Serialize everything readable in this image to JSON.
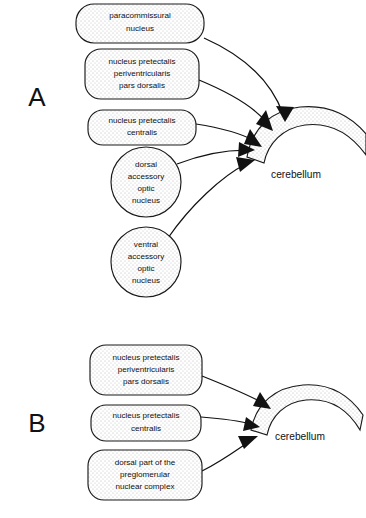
{
  "figure": {
    "background_color": "#ffffff",
    "ink_color": "#121212",
    "node_fill": "stippled-gray",
    "panels": [
      {
        "id": "A",
        "label": "A",
        "label_x": 37,
        "label_y": 99,
        "target": {
          "name": "cerebellum",
          "label": "cerebellum",
          "label_x": 296,
          "label_y": 175
        },
        "sources": [
          {
            "id": "paracommissural-nucleus",
            "shape": "rounded-rect",
            "lines": [
              "paracommissural",
              "nucleus"
            ],
            "x": 76,
            "y": 4,
            "w": 128,
            "h": 39
          },
          {
            "id": "nucleus-pretectalis-periventricularis-pars-dorsalis",
            "shape": "rounded-rect",
            "lines": [
              "nucleus pretectalis",
              "periventricularis",
              "pars dorsalis"
            ],
            "x": 85,
            "y": 49,
            "w": 114,
            "h": 50
          },
          {
            "id": "nucleus-pretectalis-centralis",
            "shape": "rounded-rect",
            "lines": [
              "nucleus pretectalis",
              "centralis"
            ],
            "x": 88,
            "y": 110,
            "w": 108,
            "h": 35
          },
          {
            "id": "dorsal-accessory-optic-nucleus",
            "shape": "circle",
            "lines": [
              "dorsal",
              "accessory",
              "optic",
              "nucleus"
            ],
            "cx": 146,
            "cy": 182,
            "r": 35
          },
          {
            "id": "ventral-accessory-optic-nucleus",
            "shape": "circle",
            "lines": [
              "ventral",
              "accessory",
              "optic",
              "nucleus"
            ],
            "cx": 146,
            "cy": 262,
            "r": 35
          }
        ],
        "connections": [
          {
            "from": "paracommissural-nucleus",
            "to": "cerebellum",
            "path": "M 204 38 C 240 54 270 78 283 114",
            "arrow_x": 285,
            "arrow_y": 120,
            "arrow_angle": 72
          },
          {
            "from": "nucleus-pretectalis-periventricularis-pars-dorsalis",
            "to": "cerebellum",
            "path": "M 199 80 C 228 92 254 106 268 124",
            "arrow_x": 271,
            "arrow_y": 128,
            "arrow_angle": 52
          },
          {
            "from": "nucleus-pretectalis-centralis",
            "to": "cerebellum",
            "path": "M 196 124 C 222 128 242 134 256 142",
            "arrow_x": 260,
            "arrow_y": 145,
            "arrow_angle": 33
          },
          {
            "from": "dorsal-accessory-optic-nucleus",
            "to": "cerebellum",
            "path": "M 177 164 C 205 153 230 150 249 150",
            "arrow_x": 254,
            "arrow_y": 150,
            "arrow_angle": 0
          },
          {
            "from": "ventral-accessory-optic-nucleus",
            "to": "cerebellum",
            "path": "M 168 238 C 190 206 222 176 248 163",
            "arrow_x": 253,
            "arrow_y": 160,
            "arrow_angle": -28
          }
        ]
      },
      {
        "id": "B",
        "label": "B",
        "label_x": 37,
        "label_y": 425,
        "target": {
          "name": "cerebellum",
          "label": "cerebellum",
          "label_x": 300,
          "label_y": 437
        },
        "sources": [
          {
            "id": "nucleus-pretectalis-periventricularis-pars-dorsalis",
            "shape": "rounded-rect",
            "lines": [
              "nucleus pretectalis",
              "periventricularis",
              "pars dorsalis"
            ],
            "x": 90,
            "y": 345,
            "w": 112,
            "h": 50
          },
          {
            "id": "nucleus-pretectalis-centralis",
            "shape": "rounded-rect",
            "lines": [
              "nucleus pretectalis",
              "centralis"
            ],
            "x": 91,
            "y": 405,
            "w": 110,
            "h": 36
          },
          {
            "id": "dorsal-part-of-the-preglomerular-nuclear-complex",
            "shape": "rounded-rect",
            "lines": [
              "dorsal part of the",
              "preglomerular",
              "nuclear complex"
            ],
            "x": 88,
            "y": 450,
            "w": 114,
            "h": 50
          }
        ],
        "connections": [
          {
            "from": "nucleus-pretectalis-periventricularis-pars-dorsalis",
            "to": "cerebellum",
            "path": "M 202 376 C 232 388 252 396 266 404",
            "arrow_x": 270,
            "arrow_y": 407,
            "arrow_angle": 35
          },
          {
            "from": "nucleus-pretectalis-centralis",
            "to": "cerebellum",
            "path": "M 201 417 C 228 419 242 422 254 425",
            "arrow_x": 259,
            "arrow_y": 426,
            "arrow_angle": 14
          },
          {
            "from": "dorsal-part-of-the-preglomerular-nuclear-complex",
            "to": "cerebellum",
            "path": "M 202 471 C 222 461 238 448 252 440",
            "arrow_x": 257,
            "arrow_y": 437,
            "arrow_angle": -32
          }
        ]
      }
    ]
  }
}
